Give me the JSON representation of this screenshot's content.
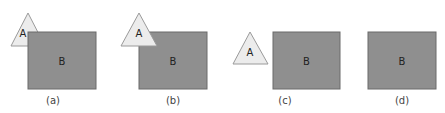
{
  "colors": {
    "rect_fill": "#8f8f8f",
    "rect_stroke": "#6a6a6a",
    "tri_fill": "#ececec",
    "tri_stroke": "#9a9a9a"
  },
  "panels": [
    {
      "caption": "(a)",
      "triangle": {
        "label": "A",
        "points": "28,13 11,46 45,46",
        "label_x": 23,
        "label_y": 37
      },
      "rect": {
        "label": "B",
        "x": 28,
        "y": 32,
        "w": 68,
        "h": 57
      },
      "triangle_on_top": false,
      "caption_x": 53
    },
    {
      "caption": "(b)",
      "triangle": {
        "label": "A",
        "points": "139,13 121,46 157,46",
        "label_x": 139,
        "label_y": 37
      },
      "rect": {
        "label": "B",
        "x": 139,
        "y": 32,
        "w": 68,
        "h": 57
      },
      "triangle_on_top": true,
      "caption_x": 173
    },
    {
      "caption": "(c)",
      "triangle": {
        "label": "A",
        "points": "250,32 233,64 268,64",
        "label_x": 250,
        "label_y": 56
      },
      "rect": {
        "label": "B",
        "x": 273,
        "y": 32,
        "w": 67,
        "h": 57
      },
      "triangle_on_top": true,
      "caption_x": 285
    },
    {
      "caption": "(d)",
      "triangle": null,
      "rect": {
        "label": "B",
        "x": 368,
        "y": 32,
        "w": 68,
        "h": 57
      },
      "triangle_on_top": false,
      "caption_x": 402
    }
  ],
  "caption_y": 104
}
